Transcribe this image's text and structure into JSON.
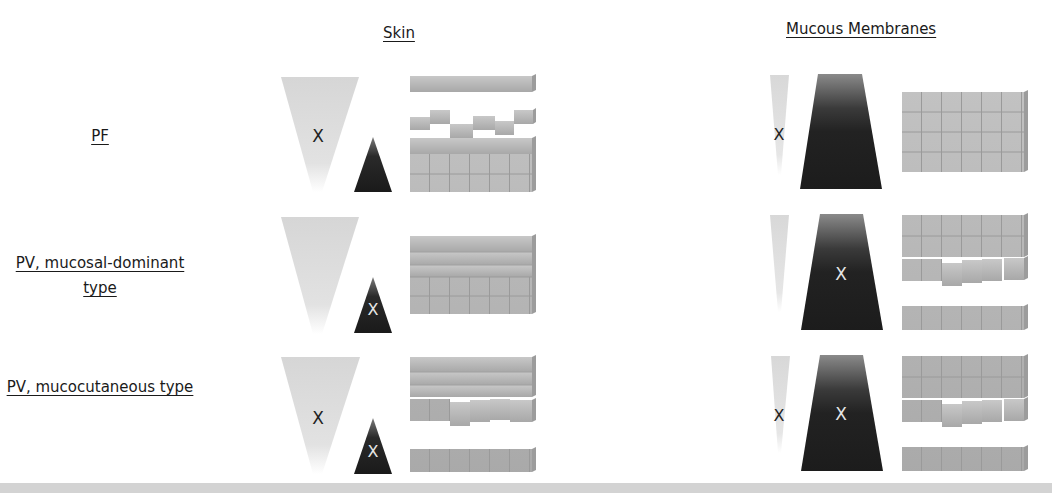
{
  "columns": {
    "skin": "Skin",
    "mucous": "Mucous Membranes"
  },
  "rows": [
    {
      "label": "PF",
      "skin": {
        "dsg1_marker": "X",
        "dsg3_marker": "",
        "epidermis": "split-upper"
      },
      "mucous": {
        "dsg1_marker": "X",
        "dsg3_marker": "",
        "epithelium": "intact"
      }
    },
    {
      "label": "PV, mucosal-dominant type",
      "skin": {
        "dsg1_marker": "",
        "dsg3_marker": "X",
        "epidermis": "intact"
      },
      "mucous": {
        "dsg1_marker": "",
        "dsg3_marker": "X",
        "epithelium": "split-suprabasal"
      }
    },
    {
      "label": "PV, mucocutaneous type",
      "skin": {
        "dsg1_marker": "X",
        "dsg3_marker": "X",
        "epidermis": "split-suprabasal"
      },
      "mucous": {
        "dsg1_marker": "X",
        "dsg3_marker": "X",
        "epithelium": "split-suprabasal"
      }
    }
  ],
  "colors": {
    "light_wedge": "#d9d9d9",
    "dark_wedge": "#1e1e1e",
    "cell": "#b5b5b5",
    "cell_edge": "#8f8f8f",
    "band": "#d3d3d3"
  }
}
